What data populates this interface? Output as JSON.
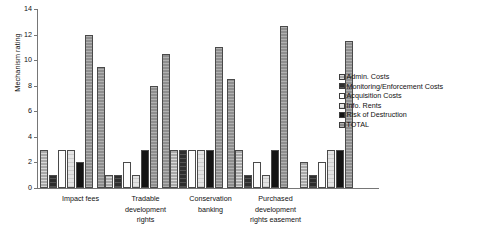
{
  "chart_data": {
    "type": "bar",
    "title": "",
    "xlabel": "",
    "ylabel": "Mechanism rating",
    "ylim": [
      0,
      14
    ],
    "yticks": [
      0,
      2,
      4,
      6,
      8,
      10,
      12,
      14
    ],
    "grid": false,
    "legend_position": "right",
    "categories": [
      "Impact fees",
      "Tradable development rights",
      "Conservation banking",
      "Purchased development rights easement",
      ""
    ],
    "category_lines": [
      [
        "Impact fees"
      ],
      [
        "Tradable",
        "development",
        "rights"
      ],
      [
        "Conservation",
        "banking"
      ],
      [
        "Purchased",
        "development",
        "rights easement"
      ],
      [
        ""
      ]
    ],
    "series": [
      {
        "name": "Admin. Costs",
        "values": [
          3,
          1,
          3,
          3,
          2
        ]
      },
      {
        "name": "Monitoring/Enforcement Costs",
        "values": [
          1,
          1,
          3,
          1,
          1
        ]
      },
      {
        "name": "Acquisition Costs",
        "values": [
          3,
          2,
          3,
          2,
          2
        ]
      },
      {
        "name": "Info. Rents",
        "values": [
          3,
          1,
          3,
          1,
          3
        ]
      },
      {
        "name": "Risk of Destruction",
        "values": [
          2,
          3,
          3,
          3,
          3
        ]
      },
      {
        "name": "TOTAL",
        "values": [
          12,
          8,
          11,
          12.7,
          11.5
        ]
      }
    ],
    "group_totals_secondary": [
      9.5,
      10.5,
      8.5
    ],
    "legend_entries": [
      "Admin. Costs",
      "Monitoring/Enforcement Costs",
      "Acquisition Costs",
      "Info. Rents",
      "Risk of Destruction",
      "TOTAL"
    ],
    "colors": {
      "admin_costs": "#a8a8a8",
      "monitoring_enforcement_costs": "#2e2e2e",
      "acquisition_costs": "#fdfdfd",
      "info_rents": "#e3e3e3",
      "risk_of_destruction": "#141414",
      "total": "#8f8f8f",
      "axis": "#767676",
      "text": "#111111",
      "background": "#ffffff"
    }
  }
}
